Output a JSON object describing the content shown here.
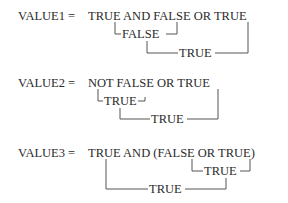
{
  "expressions": [
    {
      "name": "VALUE1",
      "lhs": "VALUE1 =",
      "tokens": [
        "TRUE",
        "AND",
        "FALSE",
        "OR",
        "TRUE"
      ],
      "text": "TRUE AND FALSE OR TRUE",
      "steps": [
        {
          "label": "FALSE",
          "spans": "TRUE AND FALSE"
        },
        {
          "label": "TRUE",
          "spans": "FALSE OR TRUE"
        }
      ]
    },
    {
      "name": "VALUE2",
      "lhs": "VALUE2 =",
      "text": "NOT FALSE OR TRUE",
      "steps": [
        {
          "label": "TRUE",
          "spans": "NOT FALSE"
        },
        {
          "label": "TRUE",
          "spans": "TRUE OR TRUE"
        }
      ]
    },
    {
      "name": "VALUE3",
      "lhs": "VALUE3 =",
      "text": "TRUE AND (FALSE OR TRUE)",
      "steps": [
        {
          "label": "TRUE",
          "spans": "(FALSE OR TRUE)"
        },
        {
          "label": "TRUE",
          "spans": "TRUE AND TRUE"
        }
      ]
    }
  ]
}
